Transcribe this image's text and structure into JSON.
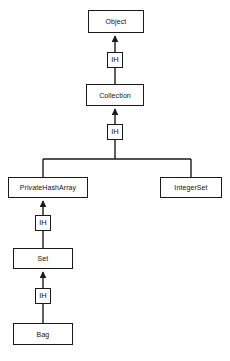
{
  "diagram": {
    "type": "class-inheritance-diagram",
    "colors": {
      "background": "#ffffff",
      "box_fill": "#ffffff",
      "box_stroke": "#1a1a1a",
      "edge": "#1a1a1a",
      "text": "#111111"
    },
    "nodes": [
      {
        "id": "object",
        "label": "Object",
        "x": 88,
        "y": 10,
        "w": 56,
        "h": 23
      },
      {
        "id": "collection",
        "label": "Collection",
        "x": 86,
        "y": 84,
        "w": 58,
        "h": 22
      },
      {
        "id": "privatehasharray",
        "label": "PrivateHashArray",
        "x": 8,
        "y": 177,
        "w": 80,
        "h": 21
      },
      {
        "id": "integerset",
        "label": "IntegerSet",
        "x": 160,
        "y": 177,
        "w": 62,
        "h": 21
      },
      {
        "id": "set",
        "label": "Set",
        "x": 13,
        "y": 248,
        "w": 60,
        "h": 21
      },
      {
        "id": "bag",
        "label": "Bag",
        "x": 13,
        "y": 323,
        "w": 60,
        "h": 22
      }
    ],
    "ih_markers": [
      {
        "id": "ih-object-collection",
        "label": "IH",
        "x": 107,
        "y": 52,
        "w": 16,
        "h": 16
      },
      {
        "id": "ih-collection-branch",
        "label": "IH",
        "x": 107,
        "y": 124,
        "w": 16,
        "h": 16
      },
      {
        "id": "ih-privatehasharray-set",
        "label": "IH",
        "x": 35,
        "y": 215,
        "w": 16,
        "h": 16
      },
      {
        "id": "ih-set-bag",
        "label": "IH",
        "x": 35,
        "y": 288,
        "w": 16,
        "h": 16
      }
    ],
    "edges": [
      {
        "id": "edge-collection-to-object",
        "from": "collection",
        "to": "object",
        "relation": "IH"
      },
      {
        "id": "edge-branch-to-collection",
        "from": "branch",
        "to": "collection",
        "relation": "IH"
      },
      {
        "id": "edge-privatehasharray-to-branch",
        "from": "privatehasharray",
        "to": "branch",
        "relation": "IH"
      },
      {
        "id": "edge-integerset-to-branch",
        "from": "integerset",
        "to": "branch",
        "relation": "IH"
      },
      {
        "id": "edge-set-to-privatehasharray",
        "from": "set",
        "to": "privatehasharray",
        "relation": "IH"
      },
      {
        "id": "edge-bag-to-set",
        "from": "bag",
        "to": "set",
        "relation": "IH"
      }
    ]
  }
}
